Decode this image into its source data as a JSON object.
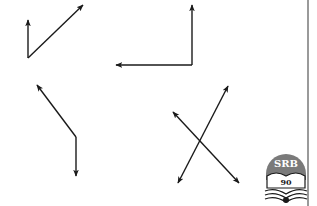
{
  "diagram": {
    "stroke_color": "#1a1a1a",
    "background": "#ffffff",
    "figures": [
      {
        "name": "figure-1-acute-angle",
        "vertex": [
          28,
          58
        ],
        "arrows": [
          [
            28,
            20
          ],
          [
            83,
            5
          ]
        ]
      },
      {
        "name": "figure-2-right-angle",
        "vertex": [
          192,
          65
        ],
        "arrows": [
          [
            192,
            5
          ],
          [
            116,
            65
          ]
        ]
      },
      {
        "name": "figure-3-obtuse-angle",
        "vertex": [
          76,
          137
        ],
        "arrows": [
          [
            37,
            85
          ],
          [
            76,
            176
          ]
        ]
      },
      {
        "name": "figure-4-intersecting-lines",
        "lines": [
          {
            "from": [
              178,
              183
            ],
            "to": [
              228,
              86
            ]
          },
          {
            "from": [
              173,
              112
            ],
            "to": [
              239,
              183
            ]
          }
        ]
      }
    ]
  },
  "logo": {
    "top_text": "SRB",
    "number": "90",
    "circle_color": "#7a7a7a"
  }
}
